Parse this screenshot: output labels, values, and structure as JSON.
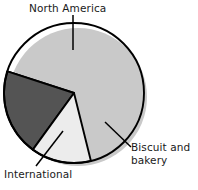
{
  "chart_data": {
    "type": "pie",
    "title": "",
    "subtitle": "",
    "xlabel": "",
    "ylabel": "",
    "legend_position": "none",
    "grid": false,
    "labels_placement": "outside-with-leader-lines",
    "categories": [
      "North America",
      "International",
      "Biscuit and bakery"
    ],
    "values": [
      66,
      20,
      14
    ],
    "slices": [
      {
        "name": "North America",
        "label": "North America",
        "value": 66,
        "color": "#a8a8a8",
        "start_angle_deg": 288,
        "end_angle_deg": 648
      },
      {
        "name": "International",
        "label": "International",
        "value": 20,
        "color": "#545454",
        "start_angle_deg": 216,
        "end_angle_deg": 288
      },
      {
        "name": "Biscuit and bakery",
        "label": "Biscuit and bakery",
        "value": 14,
        "color": "#ececec",
        "start_angle_deg": 166,
        "end_angle_deg": 216
      }
    ]
  },
  "labels": {
    "north_america": "North America",
    "biscuit_line1": "Biscuit and",
    "biscuit_line2": "bakery",
    "international": "International"
  },
  "colors": {
    "north_america": "#a8a8a8",
    "international": "#545454",
    "biscuit_and_bakery": "#ececec",
    "outline": "#000000",
    "leader_line": "#000000",
    "shadow": "#c9c9c9",
    "background": "#ffffff",
    "text": "#1a1a1a"
  }
}
